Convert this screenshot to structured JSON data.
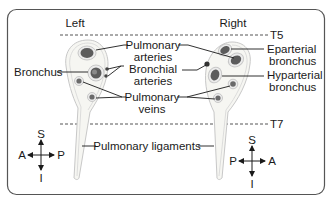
{
  "diagram": {
    "sides": {
      "left": "Left",
      "right": "Right"
    },
    "levels": {
      "upper": "T5",
      "lower": "T7"
    },
    "labels": {
      "bronchus": "Bronchus",
      "pulmonary_arteries_1": "Pulmonary",
      "pulmonary_arteries_2": "arteries",
      "bronchial_arteries_1": "Bronchial",
      "bronchial_arteries_2": "arteries",
      "pulmonary_veins_1": "Pulmonary",
      "pulmonary_veins_2": "veins",
      "eparterial_1": "Eparterial",
      "eparterial_2": "bronchus",
      "hyparterial_1": "Hyparterial",
      "hyparterial_2": "bronchus",
      "pulmonary_ligaments": "Pulmonary ligaments"
    },
    "compass_left": {
      "superior": "S",
      "inferior": "I",
      "left_end": "A",
      "right_end": "P"
    },
    "compass_right": {
      "superior": "S",
      "inferior": "I",
      "left_end": "P",
      "right_end": "A"
    },
    "colors": {
      "border": "#555555",
      "lung_outline": "#c8c8c8",
      "lung_fill": "#f4f4f0",
      "vessel_dark": "#5a5a5a",
      "vessel_ring": "#bfbfbf"
    }
  }
}
